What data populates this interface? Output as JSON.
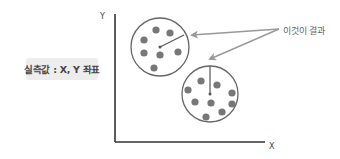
{
  "diagram": {
    "measured_label": "실측값 : X, Y 좌표",
    "callout_label": "이것이 결과",
    "y_axis_label": "Y",
    "x_axis_label": "X",
    "colors": {
      "axis": "#333333",
      "circle_stroke": "#666666",
      "dot": "#777777",
      "arrow": "#999999",
      "label_bg": "#ededed"
    },
    "clusters": [
      {
        "center": [
          160,
          47
        ],
        "radius": 29,
        "radius_line_end": [
          184,
          35
        ],
        "dots": [
          [
            156,
            30
          ],
          [
            170,
            33
          ],
          [
            144,
            40
          ],
          [
            144,
            53
          ],
          [
            160,
            55
          ],
          [
            178,
            52
          ],
          [
            154,
            68
          ]
        ]
      },
      {
        "center": [
          210,
          94
        ],
        "radius": 28,
        "radius_line_end": [
          210,
          66
        ],
        "dots": [
          [
            201,
            81
          ],
          [
            217,
            85
          ],
          [
            188,
            90
          ],
          [
            232,
            93
          ],
          [
            195,
            102
          ],
          [
            211,
            103
          ],
          [
            232,
            104
          ],
          [
            222,
            112
          ],
          [
            206,
            117
          ]
        ]
      }
    ],
    "arrows": [
      {
        "from": [
          279,
          29
        ],
        "to": [
          192,
          35
        ]
      },
      {
        "from": [
          279,
          29
        ],
        "to": [
          210,
          59
        ]
      }
    ]
  }
}
